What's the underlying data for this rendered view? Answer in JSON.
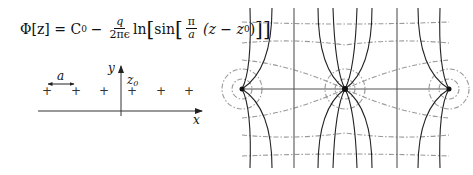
{
  "formula": {
    "lhs": "Φ[z] = C",
    "c_sub": "0",
    "minus": "−",
    "frac_num": "q",
    "frac_den": "2πϵ",
    "ln": "ln",
    "sin": "sin",
    "pi_num": "π",
    "pi_den": "a",
    "paren": "(z − z",
    "z_sub": "0",
    "close": ")"
  },
  "left_diagram": {
    "x_label": "x",
    "y_label": "y",
    "z0_label": "z",
    "z0_sub": "0",
    "spacing_label": "a",
    "charge_symbol": "+",
    "charge_count": 6
  },
  "right_diagram": {
    "description": "Field lines (solid) and equipotentials (dashed) of a periodic array of line charges",
    "charges_visible": 3,
    "colors": {
      "field_line": "#222222",
      "equipotential": "#9a9a9a",
      "axis": "#555555"
    }
  }
}
